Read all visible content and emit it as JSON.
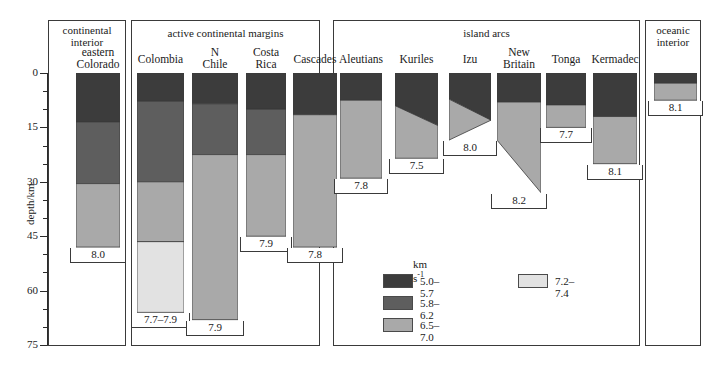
{
  "axis": {
    "title": "depth/km",
    "ticks_major": [
      0,
      15,
      30,
      45,
      60,
      75
    ],
    "tick_labels": [
      "0",
      "15",
      "30",
      "45",
      "60",
      "75"
    ],
    "minor_interval": 5,
    "range": [
      0,
      75
    ],
    "units": "km"
  },
  "groups": [
    {
      "id": "continental-interior",
      "label": "continental\ninterior"
    },
    {
      "id": "active-continental-margins",
      "label": "active continental margins"
    },
    {
      "id": "island-arcs",
      "label": "island arcs"
    },
    {
      "id": "oceanic-interior",
      "label": "oceanic\ninterior"
    }
  ],
  "legend": {
    "unit": "km s",
    "unit_exp": "-1",
    "entries": [
      {
        "label": "5.0–5.7",
        "color": "#3c3c3c"
      },
      {
        "label": "5.8–6.2",
        "color": "#5e5e5e"
      },
      {
        "label": "6.5–7.0",
        "color": "#a9a9a9"
      },
      {
        "label": "7.2–7.4",
        "color": "#e2e2e2"
      }
    ]
  },
  "colors": {
    "v50_57": "#3c3c3c",
    "v58_62": "#5e5e5e",
    "v65_70": "#a9a9a9",
    "v72_74": "#e2e2e2",
    "outline": "#3a3a3a",
    "background": "#ffffff"
  },
  "chart_data": {
    "type": "bar",
    "title": "",
    "xlabel": "",
    "ylabel": "depth/km",
    "ylim": [
      0,
      75
    ],
    "grid": false,
    "legend_position": "bottom-center",
    "columns": [
      {
        "name": "eastern\nColorado",
        "group": "continental-interior",
        "mantle_velocity": "8.0",
        "layers": [
          {
            "velocity": "5.0–5.7",
            "top": 0,
            "bottom": 13.5
          },
          {
            "velocity": "5.8–6.2",
            "top": 13.5,
            "bottom": 30.5
          },
          {
            "velocity": "6.5–7.0",
            "top": 30.5,
            "bottom": 48.0
          }
        ]
      },
      {
        "name": "Colombia",
        "group": "active-continental-margins",
        "mantle_velocity": "7.7–7.9",
        "layers": [
          {
            "velocity": "5.0–5.7",
            "top": 0,
            "bottom": 7.8
          },
          {
            "velocity": "5.8–6.2",
            "top": 7.8,
            "bottom": 30.0
          },
          {
            "velocity": "6.5–7.0",
            "top": 30.0,
            "bottom": 46.5
          },
          {
            "velocity": "7.2–7.4",
            "top": 46.5,
            "bottom": 66.0
          }
        ]
      },
      {
        "name": "N\nChile",
        "group": "active-continental-margins",
        "mantle_velocity": "7.9",
        "layers": [
          {
            "velocity": "5.0–5.7",
            "top": 0,
            "bottom": 8.5
          },
          {
            "velocity": "5.8–6.2",
            "top": 8.5,
            "bottom": 22.5
          },
          {
            "velocity": "6.5–7.0",
            "top": 22.5,
            "bottom": 68.0
          }
        ]
      },
      {
        "name": "Costa\nRica",
        "group": "active-continental-margins",
        "mantle_velocity": "7.9",
        "layers": [
          {
            "velocity": "5.0–5.7",
            "top": 0,
            "bottom": 10.0
          },
          {
            "velocity": "5.8–6.2",
            "top": 10.0,
            "bottom": 22.5
          },
          {
            "velocity": "6.5–7.0",
            "top": 22.5,
            "bottom": 45.0
          }
        ]
      },
      {
        "name": "Cascades",
        "group": "active-continental-margins",
        "mantle_velocity": "7.8",
        "layers": [
          {
            "velocity": "5.0–5.7",
            "top": 0,
            "bottom": 11.5
          },
          {
            "velocity": "6.5–7.0",
            "top": 11.5,
            "bottom": 48.0
          }
        ]
      },
      {
        "name": "Aleutians",
        "group": "island-arcs",
        "mantle_velocity": "7.8",
        "layers": [
          {
            "velocity": "5.0–5.7",
            "top": 0,
            "bottom": 7.5
          },
          {
            "velocity": "6.5–7.0",
            "top": 7.5,
            "bottom": 29.0
          }
        ]
      },
      {
        "name": "Kuriles",
        "group": "island-arcs",
        "mantle_velocity": "7.5",
        "slanted": true,
        "layers": [
          {
            "velocity": "5.0–5.7",
            "top": 0,
            "bottom_left": 9.0,
            "bottom_right": 14.5
          },
          {
            "velocity": "6.5–7.0",
            "top_left": 9.0,
            "top_right": 14.5,
            "bottom": 23.5
          }
        ]
      },
      {
        "name": "Izu",
        "group": "island-arcs",
        "mantle_velocity": "8.0",
        "slanted": true,
        "layers": [
          {
            "velocity": "5.0–5.7",
            "top": 0,
            "bottom_left": 7.2,
            "bottom_right": 13.0
          },
          {
            "velocity": "6.5–7.0",
            "top_left": 7.2,
            "top_right": 13.0,
            "bottom_left": 18.5,
            "bottom_right": 13.0
          }
        ]
      },
      {
        "name": "New\nBritain",
        "group": "island-arcs",
        "mantle_velocity": "8.2",
        "slanted": true,
        "layers": [
          {
            "velocity": "5.0–5.7",
            "top": 0,
            "bottom": 8.0
          },
          {
            "velocity": "6.5–7.0",
            "top": 8.0,
            "bottom_left": 18.5,
            "bottom_right": 33.0
          }
        ]
      },
      {
        "name": "Tonga",
        "group": "island-arcs",
        "mantle_velocity": "7.7",
        "layers": [
          {
            "velocity": "5.0–5.7",
            "top": 0,
            "bottom": 8.8
          },
          {
            "velocity": "6.5–7.0",
            "top": 8.8,
            "bottom": 15.0
          }
        ]
      },
      {
        "name": "Kermadec",
        "group": "island-arcs",
        "mantle_velocity": "8.1",
        "layers": [
          {
            "velocity": "5.0–5.7",
            "top": 0,
            "bottom": 12.0
          },
          {
            "velocity": "6.5–7.0",
            "top": 12.0,
            "bottom": 25.0
          }
        ]
      },
      {
        "name": "",
        "group": "oceanic-interior",
        "mantle_velocity": "8.1",
        "layers": [
          {
            "velocity": "5.0–5.7",
            "top": 0,
            "bottom": 2.8
          },
          {
            "velocity": "6.5–7.0",
            "top": 2.8,
            "bottom": 7.5
          }
        ]
      }
    ]
  },
  "layout": {
    "panels": [
      {
        "id": "continental-interior",
        "x": 48,
        "w": 78
      },
      {
        "id": "active-continental-margins",
        "x": 131,
        "w": 189
      },
      {
        "id": "island-arcs",
        "x": 333,
        "w": 307
      },
      {
        "id": "oceanic-interior",
        "x": 645,
        "w": 56
      }
    ],
    "columns_px": [
      {
        "name": "eastern\nColorado",
        "x": 76,
        "w": 44,
        "title_y": 46
      },
      {
        "name": "Colombia",
        "x": 137,
        "w": 47,
        "title_y": 53
      },
      {
        "name": "N\nChile",
        "x": 192,
        "w": 46,
        "title_y": 46
      },
      {
        "name": "Costa\nRica",
        "x": 246,
        "w": 40,
        "title_y": 46
      },
      {
        "name": "Cascades",
        "x": 293,
        "w": 44,
        "title_y": 53
      },
      {
        "name": "Aleutians",
        "x": 340,
        "w": 42,
        "title_y": 53
      },
      {
        "name": "Kuriles",
        "x": 395,
        "w": 43,
        "title_y": 53
      },
      {
        "name": "Izu",
        "x": 449,
        "w": 42,
        "title_y": 53
      },
      {
        "name": "New\nBritain",
        "x": 497,
        "w": 44,
        "title_y": 46
      },
      {
        "name": "Tonga",
        "x": 546,
        "w": 40,
        "title_y": 53
      },
      {
        "name": "Kermadec",
        "x": 593,
        "w": 44,
        "title_y": 53
      },
      {
        "name": "",
        "x": 654,
        "w": 43,
        "title_y": 53
      }
    ],
    "plot_top_y": 73,
    "px_per_km": 3.627,
    "frame_top_y": 20,
    "frame_bottom_y": 345
  }
}
